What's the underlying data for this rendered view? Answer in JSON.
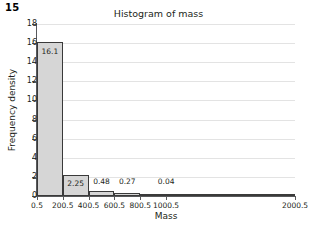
{
  "question_number": "15",
  "chart_data": {
    "type": "bar",
    "title": "Histogram of mass",
    "xlabel": "Mass",
    "ylabel": "Frequency density",
    "xlim": [
      0.5,
      2000.5
    ],
    "ylim": [
      0,
      18
    ],
    "grid": true,
    "legend": "none",
    "y_ticks": [
      18,
      16,
      14,
      12,
      10,
      8,
      6,
      4,
      2,
      0
    ],
    "x_ticks": [
      "0.5",
      "200.5",
      "400.5",
      "600.5",
      "800.5",
      "1000.5",
      "2000.5"
    ],
    "x_tick_values": [
      0.5,
      200.5,
      400.5,
      600.5,
      800.5,
      1000.5,
      2000.5
    ],
    "bins": [
      {
        "label": "16.1",
        "value": 16.1,
        "x_start": 0.5,
        "x_end": 200.5
      },
      {
        "label": "2.25",
        "value": 2.25,
        "x_start": 200.5,
        "x_end": 400.5
      },
      {
        "label": "0.48",
        "value": 0.48,
        "x_start": 400.5,
        "x_end": 600.5
      },
      {
        "label": "0.27",
        "value": 0.27,
        "x_start": 600.5,
        "x_end": 800.5
      },
      {
        "label": "0.04",
        "value": 0.04,
        "x_start": 800.5,
        "x_end": 2000.5
      }
    ],
    "colors": {
      "bar_fill": "#d6d6d6",
      "bar_border": "#3a3a3a",
      "gridline": "#e3e3e3",
      "axis": "#58595b",
      "text": "#231f20",
      "background": "#ffffff"
    }
  }
}
